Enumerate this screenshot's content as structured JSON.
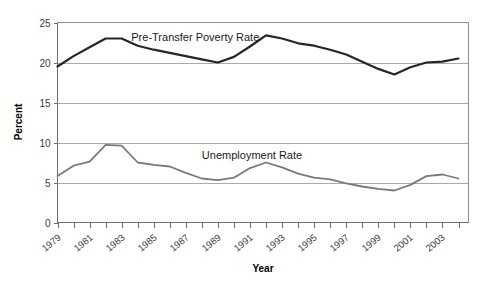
{
  "chart_data": {
    "type": "line",
    "title": "",
    "xlabel": "Year",
    "ylabel": "Percent",
    "ylim": [
      0,
      25
    ],
    "ytick_values": [
      0,
      5,
      10,
      15,
      20,
      25
    ],
    "ytick_labels": [
      "0",
      "5",
      "10",
      "15",
      "20",
      "25"
    ],
    "grid": true,
    "grid_axis": "y",
    "legend_position": "inline-annotation",
    "x": [
      1979,
      1980,
      1981,
      1982,
      1983,
      1984,
      1985,
      1986,
      1987,
      1988,
      1989,
      1990,
      1991,
      1992,
      1993,
      1994,
      1995,
      1996,
      1997,
      1998,
      1999,
      2000,
      2001,
      2002,
      2003,
      2004
    ],
    "xtick_labels": [
      "1979",
      "",
      "1981",
      "",
      "1983",
      "",
      "1985",
      "",
      "1987",
      "",
      "1989",
      "",
      "1991",
      "",
      "1993",
      "",
      "1995",
      "",
      "1997",
      "",
      "1999",
      "",
      "2001",
      "",
      "2003",
      ""
    ],
    "xtick_labels_shown": [
      "1979",
      "1981",
      "1983",
      "1985",
      "1987",
      "1989",
      "1991",
      "1993",
      "1995",
      "1997",
      "1999",
      "2001",
      "2003"
    ],
    "series": [
      {
        "name": "Pre-Transfer Poverty Rate",
        "color": "#262626",
        "width": 2.2,
        "values": [
          19.5,
          20.8,
          21.9,
          23.0,
          23.0,
          22.1,
          21.6,
          21.2,
          20.8,
          20.4,
          20.0,
          20.7,
          22.0,
          23.4,
          23.0,
          22.4,
          22.1,
          21.6,
          21.0,
          20.1,
          19.2,
          18.5,
          19.4,
          20.0,
          20.1,
          20.5
        ]
      },
      {
        "name": "Unemployment Rate",
        "color": "#7a7a7a",
        "width": 1.8,
        "values": [
          5.8,
          7.1,
          7.6,
          9.7,
          9.6,
          7.5,
          7.2,
          7.0,
          6.2,
          5.5,
          5.3,
          5.6,
          6.8,
          7.5,
          6.9,
          6.1,
          5.6,
          5.4,
          4.9,
          4.5,
          4.2,
          4.0,
          4.7,
          5.8,
          6.0,
          5.5
        ]
      }
    ],
    "annotations": [
      {
        "text": "Pre-Transfer Poverty Rate",
        "x": 1983.6,
        "y": 23.2
      },
      {
        "text": "Unemployment Rate",
        "x": 1988.0,
        "y": 8.4
      }
    ]
  }
}
